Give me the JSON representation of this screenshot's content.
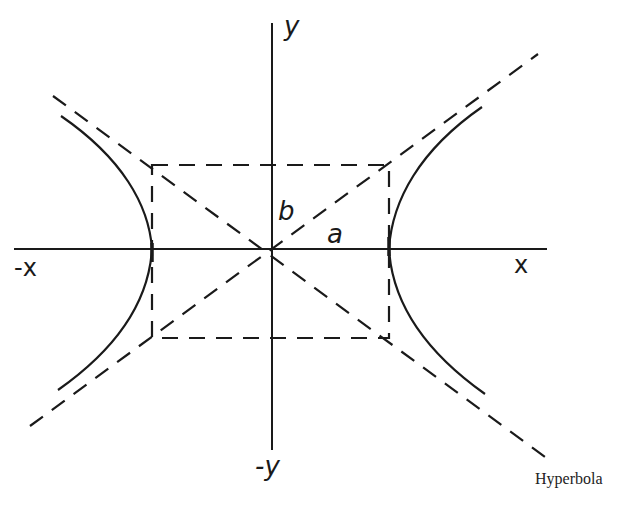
{
  "figure": {
    "caption": "Hyperbola",
    "labels": {
      "y_pos": "y",
      "y_neg": "-y",
      "x_pos": "x",
      "x_neg": "-x",
      "semi_major": "a",
      "semi_minor": "b"
    },
    "elements": {
      "axes": "horizontal x-axis and vertical y-axis crossing at center",
      "rectangle": "dashed rectangle with half-width a and half-height b",
      "asymptotes": "two dashed diagonal lines through rectangle corners",
      "branches": "two solid hyperbola branches opening left and right, touching x-axis at rectangle sides"
    },
    "colors": {
      "ink": "#1a1a1a",
      "background": "#ffffff"
    }
  }
}
